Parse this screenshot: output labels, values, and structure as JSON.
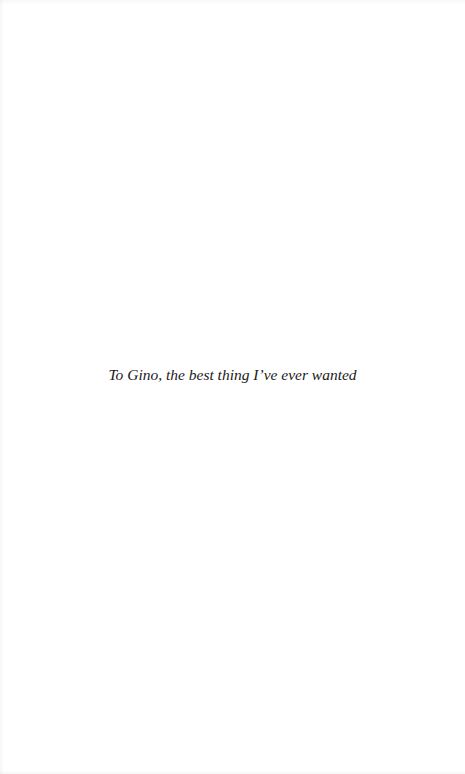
{
  "page": {
    "background": "#ffffff",
    "dedication": {
      "text": "To Gino, the best thing I’ve ever wanted",
      "color": "#1a1a1a"
    }
  }
}
